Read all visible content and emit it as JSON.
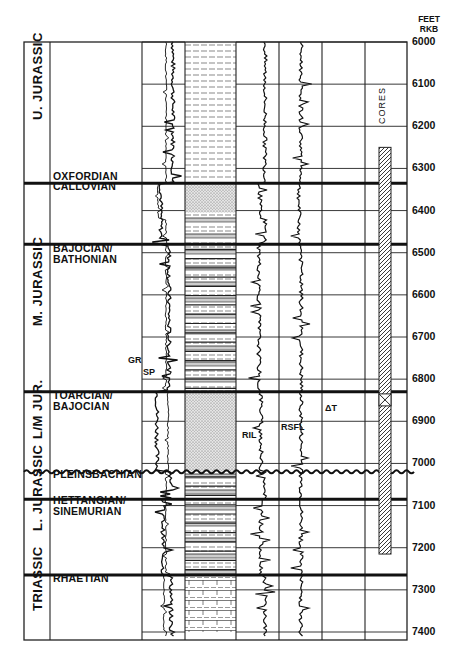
{
  "header": {
    "unit_line1": "FEET",
    "unit_line2": "RKB"
  },
  "depth_scale": {
    "start": 6000,
    "end": 7400,
    "step": 100,
    "labels": [
      "6000",
      "6100",
      "6200",
      "6300",
      "6400",
      "6500",
      "6600",
      "6700",
      "6800",
      "6900",
      "7000",
      "7100",
      "7200",
      "7300",
      "7400"
    ]
  },
  "systems": [
    {
      "label": "U. JURASSIC",
      "top": 6000,
      "base": 6335
    },
    {
      "label": "M. JURASSIC",
      "top": 6480,
      "base": 6830
    },
    {
      "label": "L/M JUR.",
      "top": 6830,
      "base": 7020
    },
    {
      "label": "L. JURASSIC",
      "top": 7020,
      "base": 7265
    },
    {
      "label": "TRIASSIC",
      "top": 7265,
      "base": 7400
    }
  ],
  "stages": [
    {
      "label": "OXFORDIAN",
      "label_depth": 6320
    },
    {
      "label": "CALLOVIAN",
      "label_depth": 6345
    },
    {
      "label": "BAJOCIAN/\nBATHONIAN",
      "label_depth": 6490
    },
    {
      "label": "TOARCIAN/\nBAJOCIAN",
      "label_depth": 6840
    },
    {
      "label": "PLEINSBACHIAN",
      "label_depth": 7028
    },
    {
      "label": "HETTANGIAN/\nSINEMURIAN",
      "label_depth": 7090
    },
    {
      "label": "RHAETIAN",
      "label_depth": 7275
    }
  ],
  "boundaries": [
    {
      "depth": 6335,
      "type": "heavy"
    },
    {
      "depth": 6480,
      "type": "heavy"
    },
    {
      "depth": 6830,
      "type": "heavy"
    },
    {
      "depth": 7020,
      "type": "unconformity"
    },
    {
      "depth": 7085,
      "type": "heavy"
    },
    {
      "depth": 7265,
      "type": "heavy"
    }
  ],
  "curve_labels": {
    "gr": "GR",
    "sp": "SP",
    "ril": "RIL",
    "rsfl": "RSFL",
    "dt": "ΔT"
  },
  "cores": {
    "label": "CORES",
    "top": 6250,
    "base": 7215
  },
  "lithology": [
    {
      "top": 6000,
      "base": 6335,
      "type": "shale"
    },
    {
      "top": 6335,
      "base": 6405,
      "type": "sand"
    },
    {
      "top": 6405,
      "base": 6480,
      "type": "mixed"
    },
    {
      "top": 6480,
      "base": 6830,
      "type": "interbedded"
    },
    {
      "top": 6830,
      "base": 7020,
      "type": "sand"
    },
    {
      "top": 7020,
      "base": 7265,
      "type": "interbedded"
    },
    {
      "top": 7265,
      "base": 7400,
      "type": "limestone"
    }
  ]
}
